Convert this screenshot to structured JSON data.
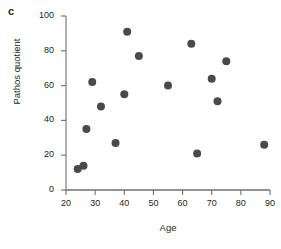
{
  "panel": {
    "label": "c"
  },
  "axes": {
    "xlabel": "Age",
    "ylabel": "Pathos quotient",
    "x_ticks": [
      "20",
      "30",
      "40",
      "50",
      "60",
      "70",
      "80",
      "90"
    ],
    "y_ticks": [
      "0",
      "20",
      "40",
      "60",
      "80",
      "100"
    ]
  },
  "colors": {
    "point": "#4a4a4a",
    "axis": "#6d6e71",
    "text": "#231f20",
    "background": "#ffffff"
  },
  "chart_data": {
    "type": "scatter",
    "title": "",
    "xlabel": "Age",
    "ylabel": "Pathos quotient",
    "xlim": [
      20,
      90
    ],
    "ylim": [
      0,
      100
    ],
    "xticks": [
      20,
      30,
      40,
      50,
      60,
      70,
      80,
      90
    ],
    "yticks": [
      0,
      20,
      40,
      60,
      80,
      100
    ],
    "grid": false,
    "legend": null,
    "marker": "circle",
    "marker_color": "#4a4a4a",
    "marker_size": 4,
    "points": [
      {
        "x": 24,
        "y": 12
      },
      {
        "x": 26,
        "y": 14
      },
      {
        "x": 27,
        "y": 35
      },
      {
        "x": 29,
        "y": 62
      },
      {
        "x": 32,
        "y": 48
      },
      {
        "x": 37,
        "y": 27
      },
      {
        "x": 40,
        "y": 55
      },
      {
        "x": 41,
        "y": 91
      },
      {
        "x": 45,
        "y": 77
      },
      {
        "x": 55,
        "y": 60
      },
      {
        "x": 63,
        "y": 84
      },
      {
        "x": 65,
        "y": 21
      },
      {
        "x": 70,
        "y": 64
      },
      {
        "x": 72,
        "y": 51
      },
      {
        "x": 75,
        "y": 74
      },
      {
        "x": 88,
        "y": 26
      }
    ]
  }
}
